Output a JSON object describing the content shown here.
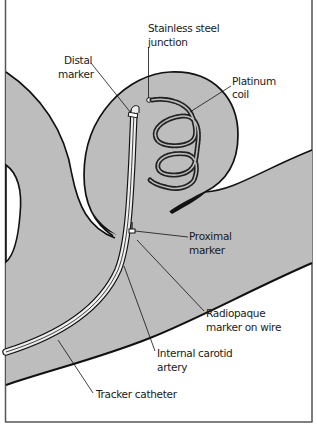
{
  "diagram": {
    "type": "medical-illustration",
    "colors": {
      "vessel_fill": "#bdbdbd",
      "outline": "#111111",
      "background": "#ffffff",
      "frame": "#555555"
    },
    "labels": {
      "stainless_steel_junction": [
        "Stainless steel",
        "junction"
      ],
      "distal_marker": [
        "Distal",
        "marker"
      ],
      "platinum_coil": [
        "Platinum",
        "coil"
      ],
      "proximal_marker": [
        "Proximal",
        "marker"
      ],
      "radiopaque_marker": [
        "Radiopaque",
        "marker on wire"
      ],
      "internal_carotid_artery": [
        "Internal carotid",
        "artery"
      ],
      "tracker_catheter": [
        "Tracker catheter"
      ]
    }
  }
}
